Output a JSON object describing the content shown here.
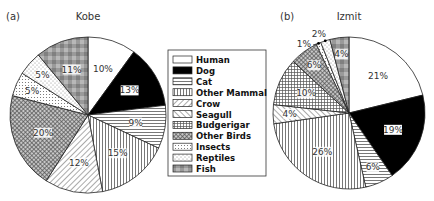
{
  "chart_data": [
    {
      "type": "pie",
      "panel": "(a)",
      "title": "Kobe",
      "slices": [
        {
          "category": "Human",
          "value": 10,
          "label": "10%"
        },
        {
          "category": "Dog",
          "value": 13,
          "label": "13%"
        },
        {
          "category": "Cat",
          "value": 9,
          "label": "9%"
        },
        {
          "category": "Other Mammal",
          "value": 15,
          "label": "15%"
        },
        {
          "category": "Crow",
          "value": 12,
          "label": "12%"
        },
        {
          "category": "Other Birds",
          "value": 20,
          "label": "20%"
        },
        {
          "category": "Insects",
          "value": 5,
          "label": "5%"
        },
        {
          "category": "Reptiles",
          "value": 5,
          "label": "5%"
        },
        {
          "category": "Fish",
          "value": 11,
          "label": "11%"
        }
      ],
      "direction": "clockwise from top"
    },
    {
      "type": "pie",
      "panel": "(b)",
      "title": "Izmit",
      "slices": [
        {
          "category": "Human",
          "value": 21,
          "label": "21%"
        },
        {
          "category": "Dog",
          "value": 19,
          "label": "19%"
        },
        {
          "category": "Cat",
          "value": 6,
          "label": "6%"
        },
        {
          "category": "Other Mammal",
          "value": 26,
          "label": "26%"
        },
        {
          "category": "Seagull",
          "value": 4,
          "label": "4%"
        },
        {
          "category": "Budgerigar",
          "value": 10,
          "label": "10%"
        },
        {
          "category": "Other Birds",
          "value": 6,
          "label": "6%"
        },
        {
          "category": "Insects",
          "value": 1,
          "label": "1%",
          "callout": true
        },
        {
          "category": "Reptiles",
          "value": 2,
          "label": "2%",
          "callout": true
        },
        {
          "category": "Fish",
          "value": 4,
          "label": "4%"
        }
      ],
      "direction": "clockwise from top"
    }
  ],
  "legend": {
    "placement": "center",
    "entries": [
      {
        "name": "Human",
        "pattern": "white"
      },
      {
        "name": "Dog",
        "pattern": "black"
      },
      {
        "name": "Cat",
        "pattern": "horizontal-lines"
      },
      {
        "name": "Other Mammal",
        "pattern": "vertical-lines"
      },
      {
        "name": "Crow",
        "pattern": "diagonal-down"
      },
      {
        "name": "Seagull",
        "pattern": "diagonal-up"
      },
      {
        "name": "Budgerigar",
        "pattern": "grid"
      },
      {
        "name": "Other Birds",
        "pattern": "crosshatch"
      },
      {
        "name": "Insects",
        "pattern": "dots"
      },
      {
        "name": "Reptiles",
        "pattern": "sparse-dots"
      },
      {
        "name": "Fish",
        "pattern": "gray-check"
      }
    ]
  }
}
